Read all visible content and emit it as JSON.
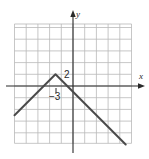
{
  "chart_data": {
    "type": "line",
    "title": "",
    "xlabel": "x",
    "ylabel": "y",
    "grid": true,
    "grid_units_per_cell": 2,
    "xlim": [
      -10,
      10
    ],
    "ylim": [
      -10,
      10
    ],
    "series": [
      {
        "name": "y = 2 - |x + 3|",
        "points": [
          {
            "x": -10,
            "y": -5
          },
          {
            "x": -3,
            "y": 2
          },
          {
            "x": 9,
            "y": -10
          }
        ],
        "color": "#4a4a4a"
      }
    ],
    "annotations": [
      {
        "text": "2",
        "at": {
          "x": -3,
          "y": 2
        },
        "meaning": "y-value of vertex"
      },
      {
        "text": "-3",
        "at": {
          "x": -3,
          "y": 0
        },
        "meaning": "x-value of vertex"
      }
    ],
    "vertex": {
      "x": -3,
      "y": 2
    }
  },
  "labels": {
    "x_axis": "x",
    "y_axis": "y",
    "vertex_y": "2",
    "vertex_x": "−3"
  },
  "colors": {
    "grid": "#b9b9b9",
    "axis": "#2a2a2a",
    "graph": "#4a4a4a",
    "background": "#ffffff"
  }
}
